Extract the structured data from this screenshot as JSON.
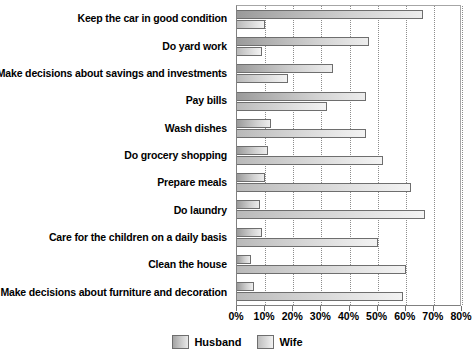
{
  "chart_data": {
    "type": "bar",
    "orientation": "horizontal",
    "title": "",
    "xlabel": "",
    "ylabel": "",
    "xlim": [
      0,
      80
    ],
    "grid": true,
    "legend_position": "bottom",
    "tick_suffix": "%",
    "ticks": [
      0,
      10,
      20,
      30,
      40,
      50,
      60,
      70,
      80
    ],
    "tick_labels": [
      "0%",
      "10%",
      "20%",
      "30%",
      "40%",
      "50%",
      "60%",
      "70%",
      "80%"
    ],
    "categories": [
      "Keep the car in good condition",
      "Do yard work",
      "Make decisions about savings and investments",
      "Pay bills",
      "Wash dishes",
      "Do grocery shopping",
      "Prepare meals",
      "Do laundry",
      "Care for the children on a daily basis",
      "Clean the house",
      "Make decisions about furniture and decoration"
    ],
    "series": [
      {
        "name": "Husband",
        "color": "#b4b4b4",
        "values": [
          66,
          47,
          34,
          46,
          12,
          11,
          10,
          8,
          9,
          5,
          6
        ]
      },
      {
        "name": "Wife",
        "color": "#d8d8d8",
        "values": [
          10,
          9,
          18,
          32,
          46,
          52,
          62,
          67,
          50,
          60,
          59
        ]
      }
    ]
  },
  "legend": {
    "items": [
      {
        "label": "Husband",
        "key": "husband"
      },
      {
        "label": "Wife",
        "key": "wife"
      }
    ]
  }
}
